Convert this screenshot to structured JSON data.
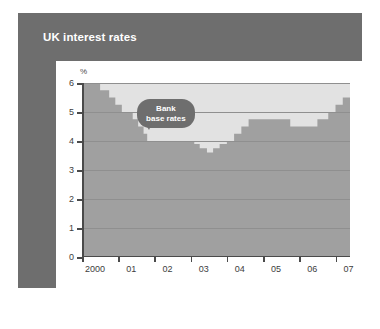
{
  "panel": {
    "title": "UK interest rates"
  },
  "annotation": {
    "line1": "Bank",
    "line2": "base rates"
  },
  "colors": {
    "panel_gray": "#6e6e6e",
    "card_white": "#ffffff",
    "area_fill": "#a0a0a0",
    "band_light": "#e2e2e2",
    "gridline": "#8f8f8f",
    "axis": "#4a4a4a",
    "title_text": "#ffffff"
  },
  "chart_data": {
    "type": "area",
    "title": "UK interest rates",
    "xlabel": "",
    "ylabel": "%",
    "ylim": [
      0,
      6
    ],
    "xlim": [
      2000,
      2007.4
    ],
    "grid": true,
    "legend": null,
    "yticks": [
      0,
      1,
      2,
      3,
      4,
      5,
      6
    ],
    "ytick_labels": [
      "0",
      "1",
      "2",
      "3",
      "4",
      "5",
      "6"
    ],
    "xticks": [
      2000,
      2001,
      2002,
      2003,
      2004,
      2005,
      2006,
      2007
    ],
    "xtick_labels": [
      "2000",
      "01",
      "02",
      "03",
      "04",
      "05",
      "06",
      "07"
    ],
    "annotations": [
      {
        "text": "Bank base rates",
        "x": 2002.35,
        "y": 5.1
      }
    ],
    "series": [
      {
        "name": "Bank base rates",
        "step": "post",
        "x": [
          2000.0,
          2000.15,
          2000.5,
          2000.75,
          2000.92,
          2001.1,
          2001.25,
          2001.4,
          2001.55,
          2001.7,
          2001.8,
          2002.9,
          2003.1,
          2003.25,
          2003.45,
          2003.62,
          2003.8,
          2004.0,
          2004.2,
          2004.4,
          2004.6,
          2005.3,
          2005.75,
          2006.1,
          2006.5,
          2006.8,
          2007.0,
          2007.2,
          2007.4
        ],
        "values": [
          6.0,
          6.0,
          5.75,
          5.5,
          5.25,
          5.0,
          5.0,
          4.75,
          4.5,
          4.25,
          4.0,
          4.0,
          3.9,
          3.75,
          3.6,
          3.75,
          3.9,
          4.0,
          4.25,
          4.5,
          4.75,
          4.75,
          4.5,
          4.5,
          4.75,
          5.0,
          5.25,
          5.5,
          5.75
        ]
      }
    ]
  }
}
